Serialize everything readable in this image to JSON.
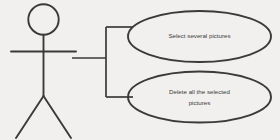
{
  "diagram": {
    "type": "uml-use-case-diagram",
    "background_color": "#f2f0ee",
    "stroke_color": "#3a3a3a",
    "text_color": "#3a3a3a",
    "actor": {
      "name": "stick-figure-actor",
      "label": ""
    },
    "use_cases": [
      {
        "id": "select-several-pictures",
        "lines": [
          "Select several pictures"
        ],
        "line1": "Select several pictures",
        "line2": ""
      },
      {
        "id": "delete-all-the-selected-pictures",
        "lines": [
          "Delete all the selected",
          "pictures"
        ],
        "line1": "Delete all the selected",
        "line2": "pictures"
      }
    ],
    "connectors": [
      {
        "id": "actor-to-bracket",
        "from": "actor",
        "to": "bracket"
      },
      {
        "id": "bracket-to-select-several-pictures",
        "from": "bracket",
        "to": "select-several-pictures"
      },
      {
        "id": "bracket-to-delete-all-the-selected-pictures",
        "from": "bracket",
        "to": "delete-all-the-selected-pictures"
      }
    ]
  }
}
